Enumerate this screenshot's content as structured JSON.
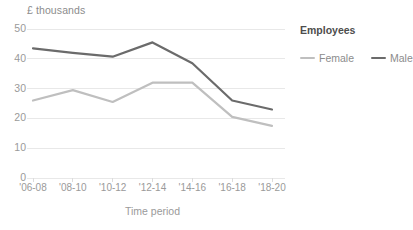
{
  "chart_data": {
    "type": "line",
    "title": "",
    "subtitle": "",
    "ylabel": "£ thousands",
    "xlabel": "Time period",
    "categories": [
      "'06-08",
      "'08-10",
      "'10-12",
      "'12-14",
      "'14-16",
      "'16-18",
      "'18-20"
    ],
    "series": [
      {
        "name": "Female",
        "color": "#bfbfbf",
        "values": [
          26,
          29.5,
          25.5,
          32,
          32,
          20.5,
          17.5
        ]
      },
      {
        "name": "Male",
        "color": "#6b6b6b",
        "values": [
          43.5,
          42,
          40.7,
          45.5,
          38.5,
          26,
          23
        ]
      }
    ],
    "ylim": [
      0,
      50
    ],
    "yticks": [
      0,
      10,
      20,
      30,
      40,
      50
    ],
    "ytick_labels": [
      "0",
      "10",
      "20",
      "30",
      "40",
      "50"
    ],
    "grid": true,
    "grid_axis": "y",
    "grid_color": "#e8e8e8",
    "legend": {
      "title": "Employees",
      "position": "right-top",
      "entries": [
        {
          "label": "Female",
          "color": "#bfbfbf"
        },
        {
          "label": "Male",
          "color": "#6b6b6b"
        }
      ]
    }
  }
}
